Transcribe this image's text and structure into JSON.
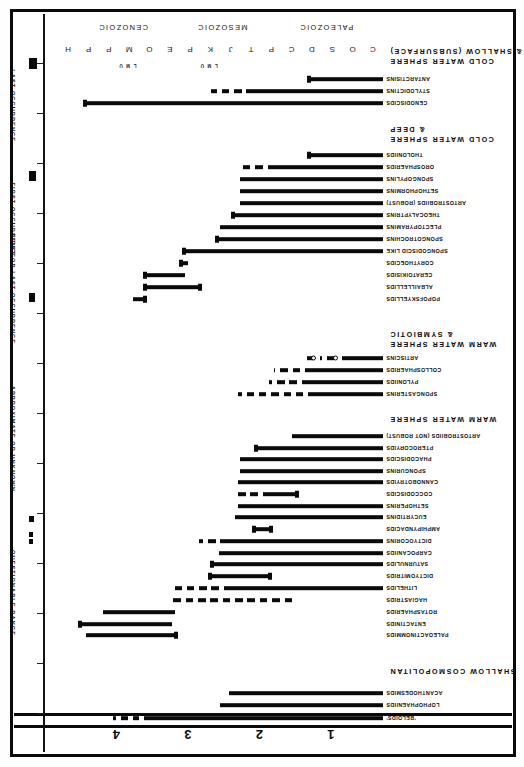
{
  "figure": {
    "orientation": "rotated-180",
    "colors": {
      "ink": "#0a0a0a",
      "paper": "#ffffff"
    }
  },
  "top_scale": {
    "label": "",
    "ticks": [
      "1",
      "2",
      "3",
      "4"
    ]
  },
  "time_axis": {
    "eras": [
      "PALEOZOIC",
      "MESOZOIC",
      "CENOZOIC"
    ],
    "periods": [
      "C",
      "O",
      "S",
      "D",
      "C",
      "P",
      "T",
      "J",
      "K",
      "P",
      "E",
      "O",
      "M",
      "P",
      "P",
      "H"
    ],
    "epochs": [
      "L",
      "M",
      "U",
      "L",
      "M",
      "U"
    ]
  },
  "legend": {
    "items": [
      {
        "label": "QUESTIONABLE RANGE",
        "swatch": "dashed-bar"
      },
      {
        "label": "APPROXIMATE OR UNKNOWN",
        "swatch": "dotted-pair"
      },
      {
        "label": "FIRST OR LAST OCCURRENCE",
        "swatch": "block"
      },
      {
        "label": "FIRST OCCURRENCE",
        "swatch": "block-left"
      },
      {
        "label": "LAST OCCURRENCE",
        "swatch": "block-right"
      }
    ]
  },
  "sections": [
    {
      "id": "shallow-cosmopolitan",
      "heading": "SHALLOW COSMOPOLITAN"
    },
    {
      "id": "warm-water-sphere",
      "heading": "WARM WATER SPHERE"
    },
    {
      "id": "warm-water-symbiotic",
      "heading": "WARM WATER SPHERE\n& SYMBIOTIC"
    },
    {
      "id": "cold-water-deep",
      "heading": "COLD WATER SPHERE\n& DEEP"
    },
    {
      "id": "cold-water-shallow",
      "heading": "COLD WATER SPHERE\n& SHALLOW (SUBSURFACE)"
    }
  ],
  "chart_data": {
    "type": "bar",
    "xlabel": "Geologic time (Paleozoic - Mesozoic - Cenozoic)",
    "ylabel": "Radiolarian group",
    "xlim": [
      0,
      100
    ],
    "grid": false,
    "legend_position": "right",
    "categories": [
      "'BELOIDS'",
      "LOPHOPHAENIIDS",
      "ACANTHODESMIDS",
      "PALEOACTINOMMIDS",
      "ENTACTINIDS",
      "ROTASPHAERIDS",
      "HAGIASTRIDS",
      "LITHELIDS",
      "DICTYOMITRIDS",
      "SATURNULIDS",
      "CARPOCANIIDS",
      "DICTYOCORINS",
      "AMPHIPYNDACIDS",
      "EUCYRTIDINS",
      "SETHOPERINS",
      "COCCODISCIDS",
      "CANNOBOTRYIDS",
      "SPONGURINS",
      "PHACODISCIDS",
      "PTEROCORYIDS",
      "ARTOSTROBIIDS (NOT ROBUST)",
      "SPONGASTERINS",
      "PYLONIIDS",
      "COLLOSPHAERIDS",
      "ARTISCINS",
      "POPOFSKYELLIDS",
      "ALBAILLELLIDS",
      "CERATOIKISIDS",
      "CORYTHOECIDS",
      "SPONGODISCID LIKE",
      "SPONGOTROCHINS",
      "PLECTOPYRAMINS",
      "THEOCALYPTRINS",
      "ARTOSTROBIIDS (ROBUST)",
      "SETHOPHORMINS",
      "SPONGOPYLINS",
      "OROSPHAERIDS",
      "THOLONIIDS",
      "CENODISCIDS",
      "STYLODICTINS",
      "ANTARCTISINS"
    ],
    "rows": [
      {
        "name": "'BELOIDS'",
        "section": "shallow-cosmopolitan",
        "segments": [
          {
            "x0": 0.0,
            "x1": 73.5,
            "style": "solid"
          },
          {
            "x0": 75.0,
            "x1": 77.0,
            "style": "dash"
          },
          {
            "x0": 78.5,
            "x1": 80.5,
            "style": "dash"
          },
          {
            "x0": 82.0,
            "x1": 83.2,
            "style": "dash"
          }
        ]
      },
      {
        "name": "LOPHOPHAENIIDS",
        "section": "shallow-cosmopolitan",
        "segments": [
          {
            "x0": 0.0,
            "x1": 50.0,
            "style": "solid"
          }
        ]
      },
      {
        "name": "ACANTHODESMIDS",
        "section": "shallow-cosmopolitan",
        "segments": [
          {
            "x0": 0.0,
            "x1": 47.5,
            "style": "solid"
          }
        ]
      },
      {
        "name": "PALEOACTINOMMIDS",
        "section": "",
        "segments": [
          {
            "x0": 63.5,
            "x1": 91.5,
            "style": "solid"
          }
        ],
        "cap_left": true
      },
      {
        "name": "ENTACTINIDS",
        "section": "",
        "segments": [
          {
            "x0": 65.0,
            "x1": 93.5,
            "style": "solid"
          }
        ],
        "cap_right": true
      },
      {
        "name": "ROTASPHAERIDS",
        "section": "",
        "segments": [
          {
            "x0": 64.0,
            "x1": 86.0,
            "style": "solid"
          }
        ]
      },
      {
        "name": "HAGIASTRIDS",
        "section": "",
        "segments": [
          {
            "x0": 28.0,
            "x1": 64.5,
            "style": "dash"
          }
        ]
      },
      {
        "name": "LITHELIDS",
        "section": "",
        "segments": [
          {
            "x0": 0.0,
            "x1": 49.0,
            "style": "solid"
          },
          {
            "x0": 50.5,
            "x1": 64.0,
            "style": "dash"
          }
        ]
      },
      {
        "name": "DICTYOMITRIDS",
        "section": "",
        "segments": [
          {
            "x0": 34.5,
            "x1": 53.5,
            "style": "solid"
          }
        ],
        "cap_left": true,
        "cap_right": true
      },
      {
        "name": "SATURNULIDS",
        "section": "",
        "segments": [
          {
            "x0": 0.0,
            "x1": 53.0,
            "style": "solid"
          }
        ],
        "cap_right": true
      },
      {
        "name": "CARPOCANIIDS",
        "section": "",
        "segments": [
          {
            "x0": 0.0,
            "x1": 50.5,
            "style": "solid"
          }
        ]
      },
      {
        "name": "DICTYOCORINS",
        "section": "",
        "segments": [
          {
            "x0": 0.0,
            "x1": 50.0,
            "style": "solid"
          },
          {
            "x0": 51.5,
            "x1": 56.5,
            "style": "dash"
          }
        ]
      },
      {
        "name": "AMPHIPYNDACIDS",
        "section": "",
        "segments": [
          {
            "x0": 34.0,
            "x1": 40.0,
            "style": "solid"
          }
        ],
        "cap_left": true,
        "cap_right": true
      },
      {
        "name": "EUCYRTIDINS",
        "section": "",
        "segments": [
          {
            "x0": 0.0,
            "x1": 45.5,
            "style": "solid"
          }
        ]
      },
      {
        "name": "SETHOPERINS",
        "section": "",
        "segments": [
          {
            "x0": 0.0,
            "x1": 44.5,
            "style": "solid"
          }
        ]
      },
      {
        "name": "COCCODISCIDS",
        "section": "",
        "segments": [
          {
            "x0": 26.0,
            "x1": 37.0,
            "style": "solid"
          },
          {
            "x0": 38.5,
            "x1": 45.0,
            "style": "dash"
          }
        ],
        "cap_left": true
      },
      {
        "name": "CANNOBOTRYIDS",
        "section": "",
        "segments": [
          {
            "x0": 0.0,
            "x1": 44.5,
            "style": "solid"
          }
        ]
      },
      {
        "name": "SPONGURINS",
        "section": "",
        "segments": [
          {
            "x0": 0.0,
            "x1": 44.0,
            "style": "solid"
          }
        ]
      },
      {
        "name": "PHACODISCIDS",
        "section": "",
        "segments": [
          {
            "x0": 0.0,
            "x1": 44.0,
            "style": "solid"
          }
        ]
      },
      {
        "name": "PTEROCORYIDS",
        "section": "",
        "segments": [
          {
            "x0": 0.0,
            "x1": 39.5,
            "style": "solid"
          }
        ],
        "cap_right": true
      },
      {
        "name": "ARTOSTROBIIDS (NOT ROBUST)",
        "section": "",
        "segments": [
          {
            "x0": 0.0,
            "x1": 28.0,
            "style": "solid"
          }
        ]
      },
      {
        "name": "SPONGASTERINS",
        "section": "warm-water-sphere",
        "segments": [
          {
            "x0": 0.0,
            "x1": 23.0,
            "style": "solid"
          },
          {
            "x0": 24.5,
            "x1": 44.5,
            "style": "dash"
          }
        ]
      },
      {
        "name": "PYLONIIDS",
        "section": "warm-water-sphere",
        "segments": [
          {
            "x0": 0.0,
            "x1": 25.0,
            "style": "solid"
          },
          {
            "x0": 26.5,
            "x1": 35.0,
            "style": "dash"
          }
        ]
      },
      {
        "name": "COLLOSPHAERIDS",
        "section": "warm-water-sphere",
        "segments": [
          {
            "x0": 0.0,
            "x1": 24.0,
            "style": "solid"
          },
          {
            "x0": 25.5,
            "x1": 33.5,
            "style": "dash"
          }
        ]
      },
      {
        "name": "ARTISCINS",
        "section": "warm-water-sphere",
        "segments": [
          {
            "x0": 0.0,
            "x1": 12.5,
            "style": "solid"
          },
          {
            "x0": 15.0,
            "x1": 19.5,
            "style": "dash"
          },
          {
            "x0": 21.5,
            "x1": 23.5,
            "style": "dash"
          }
        ],
        "open_circles": [
          13.8,
          20.6
        ]
      },
      {
        "name": "POPOFSKYELLIDS",
        "section": "warm-water-symbiotic",
        "segments": [
          {
            "x0": 73.0,
            "x1": 77.0,
            "style": "solid"
          }
        ],
        "cap_left": true
      },
      {
        "name": "ALBAILLELLIDS",
        "section": "warm-water-symbiotic",
        "segments": [
          {
            "x0": 56.0,
            "x1": 73.5,
            "style": "solid"
          }
        ],
        "cap_left": true,
        "cap_right": true
      },
      {
        "name": "CERATOIKISIDS",
        "section": "warm-water-symbiotic",
        "segments": [
          {
            "x0": 61.0,
            "x1": 73.5,
            "style": "solid"
          }
        ],
        "cap_right": true
      },
      {
        "name": "CORYTHOECIDS",
        "section": "warm-water-symbiotic",
        "segments": [
          {
            "x0": 60.0,
            "x1": 62.5,
            "style": "solid"
          }
        ],
        "cap_right": true
      },
      {
        "name": "SPONGODISCID LIKE",
        "section": "",
        "segments": [
          {
            "x0": 0.0,
            "x1": 61.5,
            "style": "solid"
          }
        ],
        "cap_right": true
      },
      {
        "name": "SPONGOTROCHINS",
        "section": "",
        "segments": [
          {
            "x0": 0.0,
            "x1": 51.5,
            "style": "solid"
          }
        ],
        "cap_right": true
      },
      {
        "name": "PLECTOPYRAMINS",
        "section": "",
        "segments": [
          {
            "x0": 0.0,
            "x1": 50.0,
            "style": "solid"
          }
        ]
      },
      {
        "name": "THEOCALYPTRINS",
        "section": "",
        "segments": [
          {
            "x0": 0.0,
            "x1": 46.5,
            "style": "solid"
          }
        ],
        "cap_right": true
      },
      {
        "name": "ARTOSTROBIIDS (ROBUST)",
        "section": "",
        "segments": [
          {
            "x0": 0.0,
            "x1": 44.0,
            "style": "solid"
          }
        ]
      },
      {
        "name": "SETHOPHORMINS",
        "section": "",
        "segments": [
          {
            "x0": 0.0,
            "x1": 44.0,
            "style": "solid"
          }
        ]
      },
      {
        "name": "SPONGOPYLINS",
        "section": "",
        "segments": [
          {
            "x0": 0.0,
            "x1": 44.0,
            "style": "solid"
          }
        ]
      },
      {
        "name": "OROSPHAERIDS",
        "section": "",
        "segments": [
          {
            "x0": 0.0,
            "x1": 35.5,
            "style": "solid"
          },
          {
            "x0": 37.0,
            "x1": 44.0,
            "style": "dash"
          }
        ]
      },
      {
        "name": "THOLONIIDS",
        "section": "",
        "segments": [
          {
            "x0": 0.0,
            "x1": 23.0,
            "style": "solid"
          }
        ],
        "cap_right": true
      },
      {
        "name": "CENODISCIDS",
        "section": "cold-water-deep",
        "segments": [
          {
            "x0": 0.0,
            "x1": 92.0,
            "style": "solid"
          }
        ],
        "cap_right": true
      },
      {
        "name": "STYLODICTINS",
        "section": "cold-water-deep",
        "segments": [
          {
            "x0": 0.0,
            "x1": 42.0,
            "style": "solid"
          },
          {
            "x0": 43.5,
            "x1": 53.0,
            "style": "dash"
          }
        ]
      },
      {
        "name": "ANTARCTISINS",
        "section": "cold-water-deep",
        "segments": [
          {
            "x0": 0.0,
            "x1": 23.0,
            "style": "solid"
          }
        ],
        "cap_right": true
      }
    ]
  }
}
